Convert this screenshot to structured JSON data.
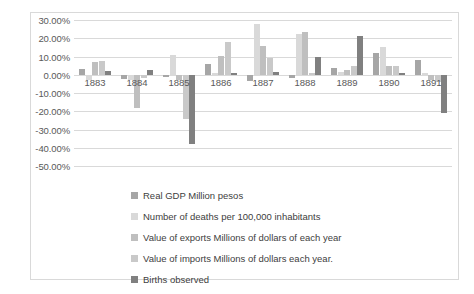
{
  "chart_data": {
    "type": "bar",
    "title": "",
    "subtitle": "",
    "xlabel": "",
    "ylabel": "",
    "grid": true,
    "legend_position": "bottom",
    "categories": [
      "1883",
      "1884",
      "1885",
      "1886",
      "1887",
      "1888",
      "1889",
      "1890",
      "1891"
    ],
    "ylim": [
      -50,
      30
    ],
    "ytick_step": 10,
    "ytick_labels": [
      "30.00%",
      "20.00%",
      "10.00%",
      "0.00%",
      "-10.00%",
      "-20.00%",
      "-30.00%",
      "-40.00%",
      "-50.00%"
    ],
    "ytick_values": [
      30,
      20,
      10,
      0,
      -10,
      -20,
      -30,
      -40,
      -50
    ],
    "value_suffix": "%",
    "series": [
      {
        "name": "Real GDP    Million pesos",
        "color": "#a6a6a6",
        "values": [
          3,
          -2.5,
          -1.5,
          6,
          -3.5,
          -2,
          3.5,
          12,
          8
        ]
      },
      {
        "name": "Number of deaths per 100,000 inhabitants",
        "color": "#d9d9d9",
        "values": [
          -3,
          -3,
          11,
          1,
          28,
          22.5,
          1.5,
          15,
          1
        ]
      },
      {
        "name": "Value of exports Millions of dollars of each year",
        "color": "#bfbfbf",
        "values": [
          7,
          -18,
          -3,
          10.5,
          15.5,
          23.5,
          2.5,
          5,
          -3
        ]
      },
      {
        "name": "Value of imports Millions of dollars each year.",
        "color": "#c9c9c9",
        "values": [
          7.5,
          -2,
          -24,
          18,
          9,
          1,
          5,
          5,
          -4
        ]
      },
      {
        "name": "Births observed",
        "color": "#808080",
        "values": [
          2,
          2.5,
          -38,
          1,
          1.5,
          10,
          21,
          1,
          -21
        ]
      }
    ]
  }
}
